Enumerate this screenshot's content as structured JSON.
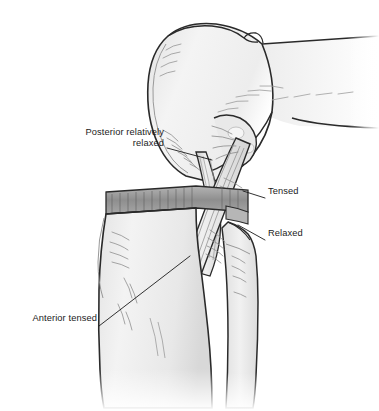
{
  "figure": {
    "background_color": "#ffffff",
    "ink_color": "#1b1b1b",
    "bone_fill_light": "#f2f2f2",
    "bone_fill_mid": "#dcdcdc",
    "band_fill": "#9a9a9a",
    "ligament_fill": "#e6e6e6"
  },
  "labels": [
    {
      "id": "posterior-relatively-relaxed",
      "text": "Posterior relatively\nrelaxed",
      "align": "right",
      "x": 74,
      "y": 127,
      "leader": {
        "x1": 167,
        "y1": 148,
        "x2": 212,
        "y2": 160
      }
    },
    {
      "id": "tensed",
      "text": "Tensed",
      "align": "left",
      "x": 268,
      "y": 192,
      "leader": {
        "x1": 265,
        "y1": 198,
        "x2": 243,
        "y2": 191
      }
    },
    {
      "id": "relaxed",
      "text": "Relaxed",
      "align": "left",
      "x": 268,
      "y": 234,
      "leader": {
        "x1": 265,
        "y1": 240,
        "x2": 238,
        "y2": 225
      }
    },
    {
      "id": "anterior-tensed",
      "text": "Anterior tensed",
      "align": "right",
      "x": 17,
      "y": 319,
      "leader": {
        "x1": 99,
        "y1": 326,
        "x2": 190,
        "y2": 256
      }
    }
  ],
  "structures": [
    {
      "id": "femur",
      "name": "femur"
    },
    {
      "id": "femoral-condyle",
      "name": "femoral condyle"
    },
    {
      "id": "intercondylar-notch",
      "name": "intercondylar notch"
    },
    {
      "id": "anterior-cruciate-ligament",
      "name": "anterior cruciate ligament"
    },
    {
      "id": "posterior-cruciate-ligament",
      "name": "posterior cruciate ligament"
    },
    {
      "id": "meniscus-band",
      "name": "meniscus band"
    },
    {
      "id": "tibia",
      "name": "tibia"
    },
    {
      "id": "tibial-plateau",
      "name": "tibial plateau"
    },
    {
      "id": "fibula",
      "name": "fibula"
    }
  ]
}
